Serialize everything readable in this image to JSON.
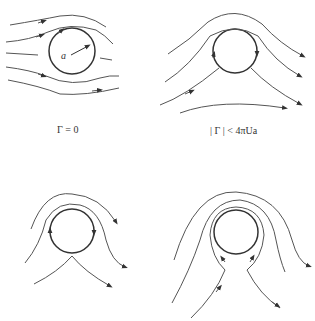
{
  "figure": {
    "panels": [
      {
        "id": "top-left",
        "caption": "Γ = 0",
        "radius_label": "a",
        "description": "Uniform flow past a cylinder with zero circulation; symmetric streamlines"
      },
      {
        "id": "top-right",
        "caption": "| Γ | < 4πUa",
        "description": "Flow past cylinder with circulation less than critical; stagnation points on surface"
      },
      {
        "id": "bottom-left",
        "caption": "",
        "description": "Critical circulation case; single stagnation point at bottom of cylinder"
      },
      {
        "id": "bottom-right",
        "caption": "",
        "description": "Supercritical circulation; stagnation point off the cylinder below, closed streamlines around cylinder"
      }
    ]
  }
}
